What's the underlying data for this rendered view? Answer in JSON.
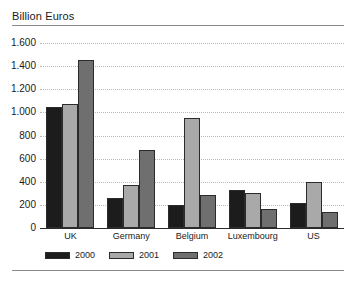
{
  "chart_data": {
    "type": "bar",
    "title": "Billion Euros",
    "xlabel": "",
    "ylabel": "",
    "ylim": [
      0,
      1600
    ],
    "ytick_step": 200,
    "ytick_labels": [
      "0",
      "200",
      "400",
      "600",
      "800",
      "1.000",
      "1.200",
      "1.400",
      "1.600"
    ],
    "ytick_values": [
      0,
      200,
      400,
      600,
      800,
      1000,
      1200,
      1400,
      1600
    ],
    "grid": true,
    "legend_position": "bottom",
    "categories": [
      "UK",
      "Germany",
      "Belgium",
      "Luxembourg",
      "US"
    ],
    "series": [
      {
        "name": "2000",
        "color": "#1c1c1c",
        "values": [
          1050,
          260,
          200,
          330,
          215
        ]
      },
      {
        "name": "2001",
        "color": "#a9a9a9",
        "values": [
          1075,
          375,
          955,
          300,
          395
        ]
      },
      {
        "name": "2002",
        "color": "#6f6f6f",
        "values": [
          1450,
          675,
          285,
          165,
          140
        ]
      }
    ]
  },
  "style": {
    "axis_color": "#2b2b2b",
    "grid_color": "#b9b9b9",
    "rule_color": "#8a8a8a",
    "background": "#ffffff"
  }
}
